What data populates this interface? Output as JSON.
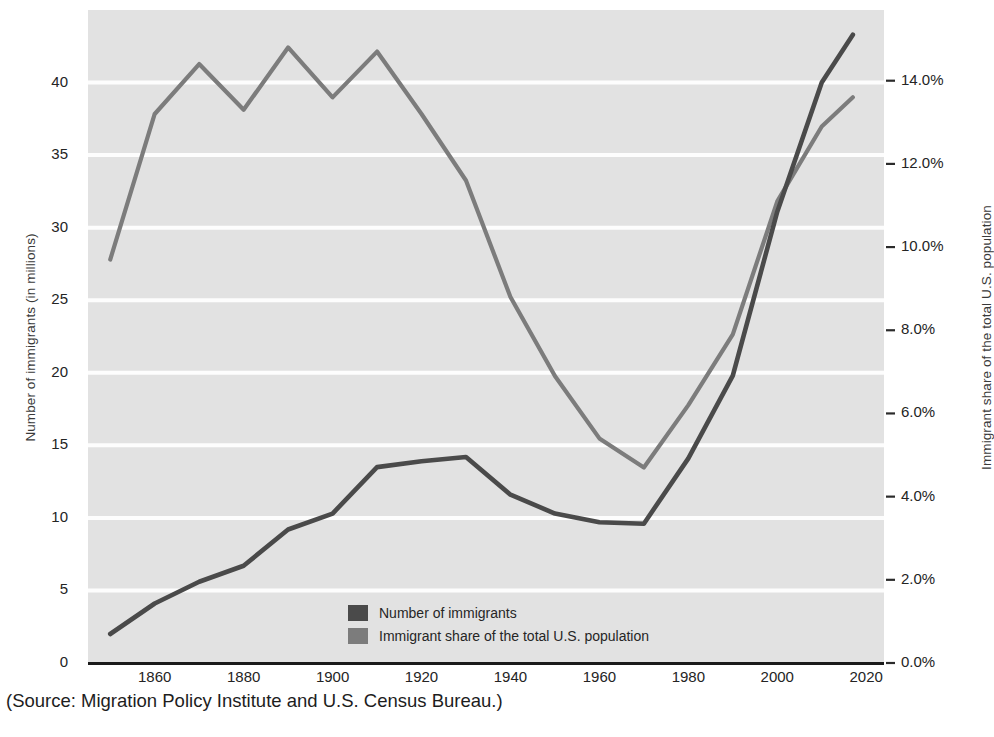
{
  "chart_data": {
    "type": "line",
    "title": "",
    "xlabel": "",
    "ylabel": "Number of immigrants (in millions)",
    "y2label": "Immigrant share of the total U.S. population",
    "x": [
      1850,
      1860,
      1870,
      1880,
      1890,
      1900,
      1910,
      1920,
      1930,
      1940,
      1950,
      1960,
      1970,
      1980,
      1990,
      2000,
      2010,
      2017
    ],
    "xlim": [
      1845,
      2024
    ],
    "xticks": [
      1860,
      1880,
      1900,
      1920,
      1940,
      1960,
      1980,
      2000,
      2020
    ],
    "xtick_labels": [
      "1860",
      "1880",
      "1900",
      "1920",
      "1940",
      "1960",
      "1980",
      "2000",
      "2020"
    ],
    "ylim": [
      0,
      45
    ],
    "yticks": [
      0,
      5,
      10,
      15,
      20,
      25,
      30,
      35,
      40
    ],
    "ytick_labels": [
      "0",
      "5",
      "10",
      "15",
      "20",
      "25",
      "30",
      "35",
      "40"
    ],
    "y2lim": [
      0,
      15.7
    ],
    "y2ticks": [
      0,
      2,
      4,
      6,
      8,
      10,
      12,
      14
    ],
    "y2tick_labels": [
      "0.0%",
      "2.0%",
      "4.0%",
      "6.0%",
      "8.0%",
      "10.0%",
      "12.0%",
      "14.0%"
    ],
    "grid": "horizontal-white-on-gray",
    "legend_position": "inside-bottom-center",
    "series": [
      {
        "name": "Number of immigrants",
        "axis": "left",
        "color": "#4a4a4a",
        "units": "millions",
        "values": [
          2.0,
          4.1,
          5.6,
          6.7,
          9.2,
          10.3,
          13.5,
          13.9,
          14.2,
          11.6,
          10.3,
          9.7,
          9.6,
          14.1,
          19.8,
          31.1,
          40.0,
          43.3
        ]
      },
      {
        "name": "Immigrant share of the total U.S. population",
        "axis": "right",
        "color": "#7c7c7c",
        "units": "percent",
        "values": [
          9.7,
          13.2,
          14.4,
          13.3,
          14.8,
          13.6,
          14.7,
          13.2,
          11.6,
          8.8,
          6.9,
          5.4,
          4.7,
          6.2,
          7.9,
          11.1,
          12.9,
          13.6
        ]
      }
    ]
  },
  "caption": {
    "source_text": "(Source: Migration Policy Institute and U.S. Census Bureau.)"
  },
  "colors": {
    "plot_background": "#e2e2e2",
    "gridline": "#fdfdfd",
    "axis_line": "#1b1b1b",
    "series_immigrants": "#4a4a4a",
    "series_share": "#7c7c7c",
    "text": "#242424"
  }
}
